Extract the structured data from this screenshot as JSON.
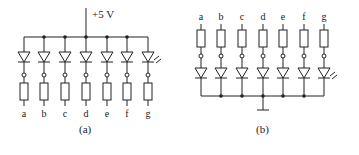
{
  "figure_a": {
    "caption": "(a)",
    "supply_label": "+5 V",
    "configuration": "common-anode",
    "segments": [
      "a",
      "b",
      "c",
      "d",
      "e",
      "f",
      "g"
    ],
    "column_x": [
      24,
      44,
      65,
      86,
      107,
      127,
      148
    ],
    "bus_y": 37,
    "supply_x": 86
  },
  "figure_b": {
    "caption": "(b)",
    "configuration": "common-cathode",
    "segments": [
      "a",
      "b",
      "c",
      "d",
      "e",
      "f",
      "g"
    ],
    "column_x": [
      201,
      221,
      242,
      263,
      283,
      304,
      324
    ],
    "bus_y": 96,
    "ground_x": 263
  },
  "colors": {
    "line": "#222222",
    "background": "#ffffff"
  }
}
